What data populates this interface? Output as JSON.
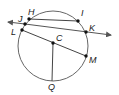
{
  "diagram": {
    "type": "circle-geometry",
    "circle": {
      "center_label": "C",
      "stroke": "#555555"
    },
    "points": [
      {
        "label": "H",
        "x": 29,
        "y": 19
      },
      {
        "label": "I",
        "x": 78,
        "y": 21
      },
      {
        "label": "J",
        "x": 25,
        "y": 24
      },
      {
        "label": "K",
        "x": 86,
        "y": 32
      },
      {
        "label": "L",
        "x": 22,
        "y": 30
      },
      {
        "label": "C",
        "x": 53,
        "y": 43
      },
      {
        "label": "M",
        "x": 86,
        "y": 56
      },
      {
        "label": "Q",
        "x": 52,
        "y": 79
      }
    ],
    "segments": [
      {
        "name": "chord-HI",
        "from": "H",
        "to": "I"
      },
      {
        "name": "diameter-LM",
        "from": "L",
        "to": "M"
      },
      {
        "name": "radius-CQ",
        "from": "C",
        "to": "Q"
      }
    ],
    "lines": [
      {
        "name": "secant-JK",
        "through": [
          "J",
          "K"
        ],
        "arrows": "both"
      }
    ]
  },
  "labels": {
    "H": "H",
    "I": "I",
    "J": "J",
    "K": "K",
    "L": "L",
    "C": "C",
    "M": "M",
    "Q": "Q"
  }
}
